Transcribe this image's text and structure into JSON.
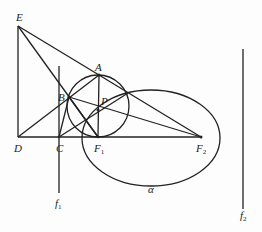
{
  "diagram": {
    "type": "geometry",
    "stroke_color": "#222222",
    "points": {
      "E": {
        "label": "E",
        "x": 18,
        "y": 26
      },
      "D": {
        "label": "D",
        "x": 18,
        "y": 137
      },
      "C": {
        "label": "C",
        "x": 59,
        "y": 137
      },
      "F1": {
        "label": "F",
        "sub": "1",
        "x": 98,
        "y": 137
      },
      "F2": {
        "label": "F",
        "sub": "2",
        "x": 201,
        "y": 137
      },
      "A": {
        "label": "A",
        "x": 99,
        "y": 75
      },
      "B": {
        "label": "B",
        "x": 69,
        "y": 97
      },
      "P": {
        "label": "P",
        "x": 98,
        "y": 110
      }
    },
    "lines": {
      "f1": {
        "label": "f",
        "sub": "1"
      },
      "f2": {
        "label": "f",
        "sub": "2"
      }
    },
    "ellipse": {
      "label": "α",
      "cx": 151,
      "cy": 138,
      "rx": 69,
      "ry": 48
    },
    "circle": {
      "cx": 98,
      "cy": 106,
      "r": 31
    }
  }
}
